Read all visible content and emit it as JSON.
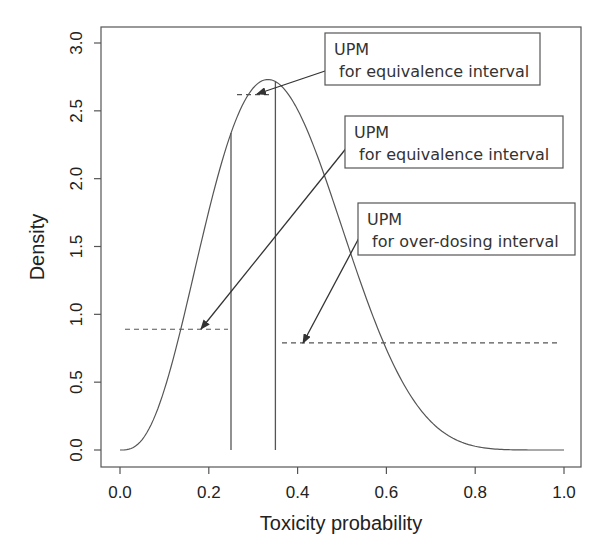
{
  "chart_data": {
    "type": "line",
    "title": "",
    "xlabel": "Toxicity probability",
    "ylabel": "Density",
    "xlim": [
      0.0,
      1.0
    ],
    "ylim": [
      0.0,
      3.0
    ],
    "x_ticks": [
      "0.0",
      "0.2",
      "0.4",
      "0.6",
      "0.8",
      "1.0"
    ],
    "y_ticks": [
      "0.0",
      "0.5",
      "1.0",
      "1.5",
      "2.0",
      "2.5",
      "3.0"
    ],
    "grid": false,
    "legend": null,
    "series": [
      {
        "name": "Posterior density (Beta-shaped)",
        "distribution": "beta",
        "alpha": 4,
        "beta": 7,
        "x": [
          0.0,
          0.05,
          0.1,
          0.15,
          0.2,
          0.25,
          0.3,
          0.333,
          0.35,
          0.4,
          0.45,
          0.5,
          0.55,
          0.6,
          0.65,
          0.7,
          0.75,
          0.8,
          0.85,
          0.9,
          0.95,
          1.0
        ],
        "values": [
          0.0,
          0.08,
          0.45,
          1.06,
          1.76,
          2.34,
          2.67,
          2.73,
          2.72,
          2.51,
          2.09,
          1.64,
          1.14,
          0.7,
          0.37,
          0.17,
          0.06,
          0.015,
          0.003,
          0.0,
          0.0,
          0.0
        ]
      }
    ],
    "vertical_lines": [
      {
        "x": 0.25,
        "label": "lower bound of equivalence interval"
      },
      {
        "x": 0.35,
        "label": "upper bound of equivalence interval"
      }
    ],
    "dashed_lines": [
      {
        "name": "UPM under-dosing",
        "x_start": 0.0,
        "x_end": 0.25,
        "y": 0.89
      },
      {
        "name": "UPM equivalence",
        "x_start": 0.25,
        "x_end": 0.35,
        "y": 2.62
      },
      {
        "name": "UPM over-dosing",
        "x_start": 0.35,
        "x_end": 1.0,
        "y": 0.79
      }
    ],
    "annotations": [
      {
        "line1": "UPM",
        "line2": "for equivalence interval",
        "arrow_to": [
          0.31,
          2.62
        ]
      },
      {
        "line1": "UPM",
        "line2": "for equivalence interval",
        "arrow_to": [
          0.18,
          0.89
        ]
      },
      {
        "line1": "UPM",
        "line2": "for over-dosing interval",
        "arrow_to": [
          0.41,
          0.79
        ]
      }
    ]
  },
  "labels": {
    "xlabel": "Toxicity probability",
    "ylabel": "Density",
    "x_ticks": [
      "0.0",
      "0.2",
      "0.4",
      "0.6",
      "0.8",
      "1.0"
    ],
    "y_ticks": [
      "0.0",
      "0.5",
      "1.0",
      "1.5",
      "2.0",
      "2.5",
      "3.0"
    ],
    "annotations": [
      {
        "line1": "UPM",
        "line2": " for equivalence interval"
      },
      {
        "line1": "UPM",
        "line2": " for equivalence interval"
      },
      {
        "line1": "UPM",
        "line2": " for over-dosing interval"
      }
    ]
  },
  "colors": {
    "line": "#555555",
    "axis": "#555555",
    "text": "#222222",
    "box": "#555555"
  }
}
